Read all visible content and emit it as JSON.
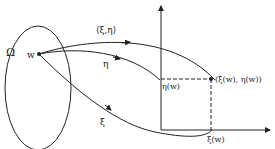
{
  "diagram": {
    "region_label": "Ω",
    "point_label": "w",
    "arrow_labels": {
      "pair_map": "⟨ξ,η⟩",
      "eta_map": "η",
      "xi_map": "ξ"
    },
    "axis_labels": {
      "eta_value": "η(w)",
      "xi_value": "ξ(w)"
    },
    "image_point_label": "(ξ(w), η(w))"
  }
}
